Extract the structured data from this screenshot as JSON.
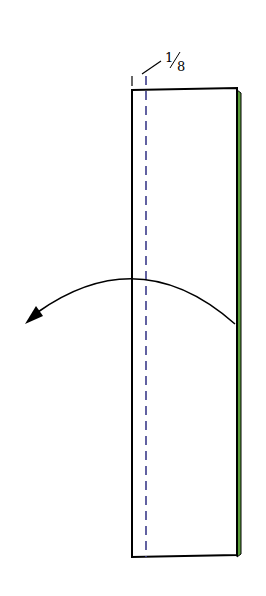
{
  "diagram": {
    "type": "origami-fold-instruction",
    "fold_label": {
      "numerator": "1",
      "denominator": "8",
      "text": "1/8"
    },
    "colors": {
      "paper_front": "#ffffff",
      "paper_back": "#5a9e3a",
      "outline": "#000000",
      "valley_fold_line": "#3b3b8a",
      "arrow": "#000000"
    },
    "instruction": "Valley fold 1/8 along dashed line, fold left"
  }
}
